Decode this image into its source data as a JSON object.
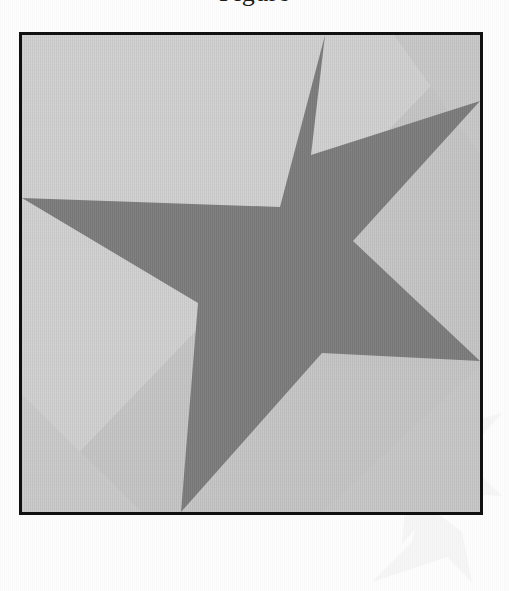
{
  "page": {
    "background_color": "#fdfdfd",
    "width": 509,
    "height": 591
  },
  "caption": {
    "text": "Figure",
    "note": "cropped descender visible at top edge of page"
  },
  "watermark": {
    "name": "star-watermark",
    "color": "#8a8a8a",
    "opacity": "0.055"
  },
  "figure": {
    "border_color": "#111111",
    "border_width": 3,
    "frame": {
      "x": 19,
      "y": 32,
      "width": 464,
      "height": 483
    }
  },
  "chart_data": {
    "type": "scatter",
    "xlabel": "",
    "ylabel": "",
    "xlim": [
      0,
      458
    ],
    "ylim": [
      0,
      477
    ],
    "grid": false,
    "legend": null,
    "shapes": [
      {
        "name": "background-facet-upper-left",
        "role": "background",
        "fill": "#d2d2d2",
        "points": [
          [
            0,
            0
          ],
          [
            458,
            0
          ],
          [
            0,
            477
          ]
        ]
      },
      {
        "name": "background-facet-lower-right",
        "role": "background",
        "fill": "#c6c6c6",
        "points": [
          [
            458,
            0
          ],
          [
            458,
            477
          ],
          [
            0,
            477
          ]
        ]
      },
      {
        "name": "background-facet-top-right-wedge",
        "role": "background",
        "fill": "#c9c9c9",
        "points": [
          [
            372,
            0
          ],
          [
            458,
            0
          ],
          [
            458,
            120
          ]
        ]
      },
      {
        "name": "background-facet-bottom-left-wedge",
        "role": "background",
        "fill": "#cbcbcb",
        "points": [
          [
            0,
            360
          ],
          [
            0,
            477
          ],
          [
            120,
            477
          ]
        ]
      },
      {
        "name": "star-polygon",
        "role": "foreground",
        "fill": "#7d7d7d",
        "points": [
          [
            303,
            0
          ],
          [
            258,
            172
          ],
          [
            0,
            163
          ],
          [
            176,
            268
          ],
          [
            159,
            477
          ],
          [
            300,
            318
          ],
          [
            458,
            326
          ],
          [
            331,
            206
          ],
          [
            458,
            66
          ],
          [
            289,
            120
          ]
        ],
        "description": "irregular five-pointed star, tips touch top, left, right and bottom edges"
      }
    ],
    "colors": {
      "star_fill": "#7d7d7d",
      "background_light": "#d2d2d2",
      "background_mid": "#c9c9c9",
      "background_dark": "#c6c6c6",
      "frame_stroke": "#111111"
    }
  }
}
